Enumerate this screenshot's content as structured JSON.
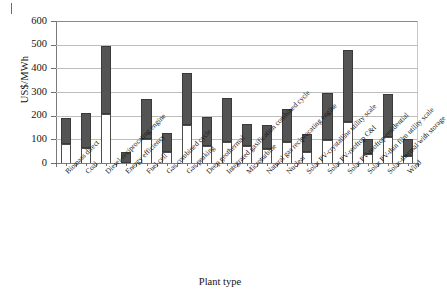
{
  "figure": {
    "artifact_note": "",
    "x_axis_title": "Plant type",
    "y_axis_title": "US$/MWh"
  },
  "chart_data": {
    "type": "bar",
    "title": "",
    "subtitle": "",
    "xlabel": "Plant type",
    "ylabel": "US$/MWh",
    "ylim": [
      0,
      600
    ],
    "yticks": [
      0,
      100,
      200,
      300,
      400,
      500,
      600
    ],
    "grid": true,
    "legend": "none",
    "stacked": true,
    "note": "Floating/range bars: each category spans from a low value to a high value. The white lower segment runs 0 to low; the dark segment runs low to high.",
    "categories": [
      "Biomass direct",
      "Coal",
      "Diesel-reciprocating engine",
      "Energy efficiency",
      "Fuel cell",
      "Gas combined cycle",
      "Gas peaking",
      "Deep geothermal",
      "Integrated gasification combined cycle",
      "Microturbine",
      "Natural gas reciprocating engine",
      "Nuclear",
      "Solar PV-crystalline utility scale",
      "Solar PV-rooftop C&I",
      "Solar PV-rooftop residential",
      "Solar PV-thin film utility scale",
      "Solar-thermal with storage",
      "Wind"
    ],
    "series": [
      {
        "name": "Low",
        "values": [
          80,
          62,
          205,
          0,
          102,
          47,
          160,
          74,
          88,
          72,
          60,
          87,
          46,
          98,
          175,
          39,
          108,
          28
        ]
      },
      {
        "name": "High",
        "values": [
          192,
          213,
          495,
          46,
          271,
          126,
          380,
          195,
          275,
          163,
          162,
          227,
          121,
          296,
          478,
          103,
          291,
          100
        ]
      }
    ]
  }
}
